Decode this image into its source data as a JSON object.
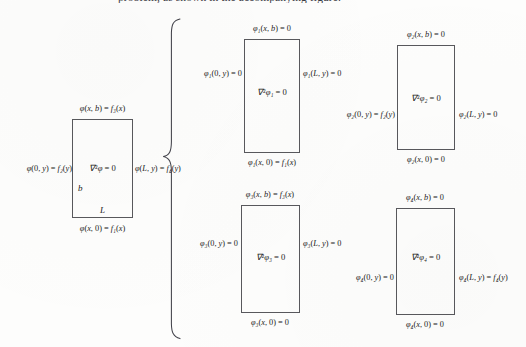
{
  "page": {
    "top_cut_text": "problem, as shown in the accompanying figure.",
    "background_color": "#fdfdfc",
    "ink_color": "#1b1b20",
    "box_stroke_color": "#58585c"
  },
  "original_problem": {
    "name": "original-laplace-problem",
    "interior_equation": "∇²φ = 0",
    "top_bc": "φ(x, b) = f₃(x)",
    "left_bc": "φ(0, y) = f₂(y)",
    "right_bc": "φ(L, y) = f₄(y)",
    "bottom_bc": "φ(x, 0) = f₁(x)",
    "height_label": "b",
    "width_label": "L"
  },
  "brace": {
    "name": "equals-sum-brace",
    "glyph": "{"
  },
  "subproblems": [
    {
      "id": "phi1",
      "name": "subproblem-phi1",
      "interior_equation": "∇²φ₁ = 0",
      "top_bc": "φ₁(x, b) = 0",
      "left_bc": "φ₁(0, y) = 0",
      "right_bc": "φ₁(L, y) = 0",
      "bottom_bc": "φ₁(x, 0) = f₁(x)",
      "inhomogeneous_edge": "bottom"
    },
    {
      "id": "phi2",
      "name": "subproblem-phi2",
      "interior_equation": "∇²φ₂ = 0",
      "top_bc": "φ₂(x, b) = 0",
      "left_bc": "φ₂(0, y) = f₂(y)",
      "right_bc": "φ₂(L, y) = 0",
      "bottom_bc": "φ₂(x, 0) = 0",
      "inhomogeneous_edge": "left"
    },
    {
      "id": "phi3",
      "name": "subproblem-phi3",
      "interior_equation": "∇²φ₃ = 0",
      "top_bc": "φ₃(x, b) = f₃(x)",
      "left_bc": "φ₃(0, y) = 0",
      "right_bc": "φ₃(L, y) = 0",
      "bottom_bc": "φ₃(x, 0) = 0",
      "inhomogeneous_edge": "top"
    },
    {
      "id": "phi4",
      "name": "subproblem-phi4",
      "interior_equation": "∇²φ₄ = 0",
      "top_bc": "φ₄(x, b) = 0",
      "left_bc": "φ₄(0, y) = 0",
      "right_bc": "φ₄(L, y) = f₄(y)",
      "bottom_bc": "φ₄(x, 0) = 0",
      "inhomogeneous_edge": "right"
    }
  ]
}
